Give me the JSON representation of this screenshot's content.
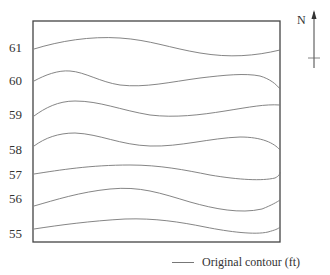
{
  "figure": {
    "north_label": "N",
    "legend": {
      "label": "Original contour (ft)",
      "line_color": "#777777"
    },
    "frame_color": "#444444",
    "contour_color": "#777777"
  },
  "contours": [
    {
      "elevation": "61",
      "label_y": 48
    },
    {
      "elevation": "60",
      "label_y": 81
    },
    {
      "elevation": "59",
      "label_y": 115
    },
    {
      "elevation": "58",
      "label_y": 150
    },
    {
      "elevation": "57",
      "label_y": 175
    },
    {
      "elevation": "56",
      "label_y": 199
    },
    {
      "elevation": "55",
      "label_y": 233
    }
  ]
}
